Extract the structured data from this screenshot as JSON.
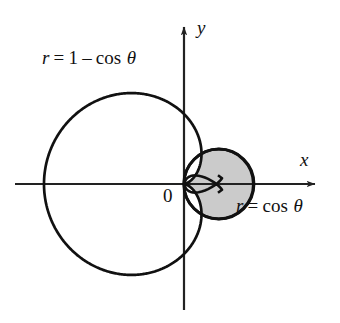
{
  "figure": {
    "kind": "polar-curve-diagram",
    "background_color": "#ffffff",
    "curve_color": "#111111",
    "axis_color": "#222222",
    "shade_color": "#cbcbcb",
    "origin_px": [
      184,
      184
    ],
    "unit_px": 70
  },
  "axes": {
    "x_label": "x",
    "y_label": "y",
    "origin_label": "0",
    "x_axis_from_px": [
      15,
      184
    ],
    "x_axis_to_px": [
      322,
      184
    ],
    "y_axis_from_px": [
      184,
      310
    ],
    "y_axis_to_px": [
      184,
      20
    ]
  },
  "labels": {
    "cardioid": {
      "r": "r",
      "equals": "=",
      "one": "1",
      "minus": "–",
      "cos": "cos",
      "theta": "θ",
      "full_text": "r = 1 – cos θ"
    },
    "circle": {
      "r": "r",
      "equals": "=",
      "cos": "cos",
      "theta": "θ",
      "full_text": "r = cos θ"
    }
  },
  "chart_data": {
    "type": "line",
    "title": "",
    "xlabel": "x",
    "ylabel": "y",
    "coordinate_system": "polar",
    "grid": false,
    "legend": "inline-annotations",
    "annotations": [
      {
        "text": "r = 1 – cos θ",
        "target": "cardioid",
        "position_px": [
          42,
          48
        ]
      },
      {
        "text": "r = cos θ",
        "target": "circle",
        "position_px": [
          236,
          196
        ]
      },
      {
        "text": "0",
        "target": "origin",
        "position_px": [
          163,
          186
        ]
      }
    ],
    "series": [
      {
        "name": "r = 1 – cos θ",
        "curve_type": "cardioid",
        "equation": "r = 1 - cos(theta)",
        "theta_range_deg": [
          0,
          360
        ],
        "r_max": 2,
        "r_min": 0,
        "filled": false,
        "sampled_points_polar": [
          {
            "theta_deg": 0,
            "r": 0
          },
          {
            "theta_deg": 30,
            "r": 0.134
          },
          {
            "theta_deg": 60,
            "r": 0.5
          },
          {
            "theta_deg": 90,
            "r": 1
          },
          {
            "theta_deg": 120,
            "r": 1.5
          },
          {
            "theta_deg": 150,
            "r": 1.866
          },
          {
            "theta_deg": 180,
            "r": 2
          },
          {
            "theta_deg": 210,
            "r": 1.866
          },
          {
            "theta_deg": 240,
            "r": 1.5
          },
          {
            "theta_deg": 270,
            "r": 1
          },
          {
            "theta_deg": 300,
            "r": 0.5
          },
          {
            "theta_deg": 330,
            "r": 0.134
          },
          {
            "theta_deg": 360,
            "r": 0
          }
        ]
      },
      {
        "name": "r = cos θ",
        "curve_type": "circle",
        "equation": "r = cos(theta)",
        "theta_range_deg": [
          -90,
          90
        ],
        "r_max": 1,
        "r_min": 0,
        "center_xy": [
          0.5,
          0
        ],
        "radius": 0.5,
        "filled": true,
        "fill_color": "#cbcbcb",
        "sampled_points_polar": [
          {
            "theta_deg": -90,
            "r": 0
          },
          {
            "theta_deg": -60,
            "r": 0.5
          },
          {
            "theta_deg": -30,
            "r": 0.866
          },
          {
            "theta_deg": 0,
            "r": 1
          },
          {
            "theta_deg": 30,
            "r": 0.866
          },
          {
            "theta_deg": 60,
            "r": 0.5
          },
          {
            "theta_deg": 90,
            "r": 0
          }
        ]
      }
    ],
    "shaded_region": {
      "description": "Region inside the circle r = cos θ and outside the cardioid r = 1 – cos θ",
      "color": "#cbcbcb",
      "intersection_theta_deg": [
        -60,
        60
      ]
    },
    "axis_extent_units": {
      "x": [
        -2.4,
        1.97
      ],
      "y": [
        -1.8,
        2.34
      ]
    }
  }
}
